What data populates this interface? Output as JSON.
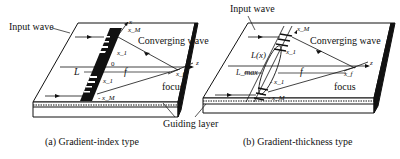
{
  "panels": [
    {
      "id": "a",
      "caption": "(a)  Gradient-index type",
      "labels": {
        "input_wave": "Input wave",
        "converging_wave": "Converging wave",
        "focus": "focus",
        "axis_x": "x",
        "axis_z": "z",
        "x_m_top": "x_M",
        "x_1_top": "x_1",
        "origin": "0",
        "L": "L",
        "f": "f",
        "x_1_bottom": "x_1",
        "x_m_bottom": "- x_M",
        "x_f": "x_f"
      }
    },
    {
      "id": "b",
      "caption": "(b)  Gradient-thickness type",
      "labels": {
        "input_wave": "Input wave",
        "converging_wave": "Converging wave",
        "focus": "focus",
        "axis_z": "z",
        "x_m_top": "x_M",
        "x_1_top": "x_1",
        "L_x": "L(x)",
        "L_max": "L_max",
        "f": "f",
        "x_1_bottom": "- x_1",
        "x_m_bottom": "- x_M",
        "x_f": "x_f"
      }
    }
  ],
  "shared": {
    "guiding_layer": "Guiding layer"
  },
  "colors": {
    "ink": "#111111",
    "background": "#ffffff"
  }
}
